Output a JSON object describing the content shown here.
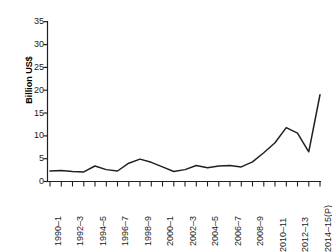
{
  "chart_data": {
    "type": "line",
    "title": "",
    "xlabel": "",
    "ylabel": "Billion US$",
    "ylim": [
      0,
      35
    ],
    "yticks": [
      0,
      5,
      10,
      15,
      20,
      25,
      30,
      35
    ],
    "grid": false,
    "legend": "none",
    "categories": [
      "1990–1",
      "1991–2",
      "1992–3",
      "1993–4",
      "1994–5",
      "1995–6",
      "1996–7",
      "1997–8",
      "1998–9",
      "1999–2000",
      "2000–1",
      "2001–2",
      "2002–3",
      "2003–4",
      "2004–5",
      "2005–6",
      "2006–7",
      "2007–8",
      "2008–9",
      "2009–10",
      "2010–11",
      "2011–12",
      "2012–13",
      "2013–14",
      "2014–15(P)"
    ],
    "tick_labels_visible": [
      "1990–1",
      "1992–3",
      "1994–5",
      "1996–7",
      "1998–9",
      "2000–1",
      "2002–3",
      "2004–5",
      "2006–7",
      "2008–9",
      "2010–11",
      "2012–13",
      "2014–15(P)"
    ],
    "values": [
      2.3,
      2.4,
      2.3,
      2.1,
      3.4,
      2.7,
      2.3,
      4.0,
      4.9,
      4.2,
      3.2,
      2.2,
      2.6,
      3.5,
      3.0,
      3.4,
      3.5,
      3.2,
      4.3,
      6.0,
      8.0,
      9.5,
      11.8,
      10.6,
      10.0
    ],
    "values_full": [
      2.3,
      2.4,
      2.3,
      2.1,
      3.4,
      2.7,
      2.3,
      4.0,
      4.9,
      4.2,
      3.2,
      2.2,
      2.6,
      3.5,
      3.0,
      3.4,
      3.5,
      3.2,
      4.3,
      6.0,
      8.0,
      11.8,
      10.6,
      6.5,
      13.5
    ],
    "series": [
      {
        "name": "FDI inflows",
        "x": [
          "1990–1",
          "1991–2",
          "1992–3",
          "1993–4",
          "1994–5",
          "1995–6",
          "1996–7",
          "1997–8",
          "1998–9",
          "1999–2000",
          "2000–1",
          "2001–2",
          "2002–3",
          "2003–4",
          "2004–5",
          "2005–6",
          "2006–7",
          "2007–8",
          "2008–9",
          "2009–10",
          "2010–11",
          "2011–12",
          "2012–13",
          "2013–14",
          "2014–15(P)"
        ],
        "values": [
          2.3,
          2.4,
          2.2,
          2.1,
          3.4,
          2.6,
          2.3,
          4.0,
          4.9,
          4.2,
          3.2,
          2.2,
          2.6,
          3.5,
          3.0,
          3.4,
          3.5,
          3.2,
          4.3,
          6.3,
          8.5,
          11.8,
          10.6,
          6.5,
          19.0
        ],
        "color": "#231f20"
      }
    ],
    "data_points": [
      {
        "x": "1990–1",
        "y": 2.3
      },
      {
        "x": "1991–2",
        "y": 2.4
      },
      {
        "x": "1992–3",
        "y": 2.2
      },
      {
        "x": "1993–4",
        "y": 2.1
      },
      {
        "x": "1994–5",
        "y": 3.4
      },
      {
        "x": "1995–6",
        "y": 2.6
      },
      {
        "x": "1996–7",
        "y": 2.3
      },
      {
        "x": "1997–8",
        "y": 4.0
      },
      {
        "x": "1998–9",
        "y": 4.9
      },
      {
        "x": "1999–2000",
        "y": 4.2
      },
      {
        "x": "2000–1",
        "y": 3.2
      },
      {
        "x": "2001–2",
        "y": 2.2
      },
      {
        "x": "2002–3",
        "y": 2.6
      },
      {
        "x": "2003–4",
        "y": 3.5
      },
      {
        "x": "2004–5",
        "y": 3.0
      },
      {
        "x": "2005–6",
        "y": 3.4
      },
      {
        "x": "2006–7",
        "y": 3.5
      },
      {
        "x": "2007–8",
        "y": 3.2
      },
      {
        "x": "2008–9",
        "y": 4.3
      },
      {
        "x": "2009–10",
        "y": 6.3
      },
      {
        "x": "2010–11",
        "y": 8.5
      },
      {
        "x": "2011–12",
        "y": 11.8
      },
      {
        "x": "2012–13",
        "y": 10.6
      },
      {
        "x": "2013–14",
        "y": 6.5
      },
      {
        "x": "2014–15(P)",
        "y": 19.0
      }
    ],
    "line_color": "#231f20",
    "axis_color": "#231f20"
  },
  "axis": {
    "y_title": "Billion US$",
    "y_tick_0": "0",
    "y_tick_1": "5",
    "y_tick_2": "10",
    "y_tick_3": "15",
    "y_tick_4": "20",
    "y_tick_5": "25",
    "y_tick_6": "30",
    "y_tick_7": "35",
    "x_label_0": "1990–1",
    "x_label_1": "1992–3",
    "x_label_2": "1994–5",
    "x_label_3": "1996–7",
    "x_label_4": "1998–9",
    "x_label_5": "2000–1",
    "x_label_6": "2002–3",
    "x_label_7": "2004–5",
    "x_label_8": "2006–7",
    "x_label_9": "2008–9",
    "x_label_10": "2010–11",
    "x_label_11": "2012–13",
    "x_label_12": "2014–15(P)"
  }
}
